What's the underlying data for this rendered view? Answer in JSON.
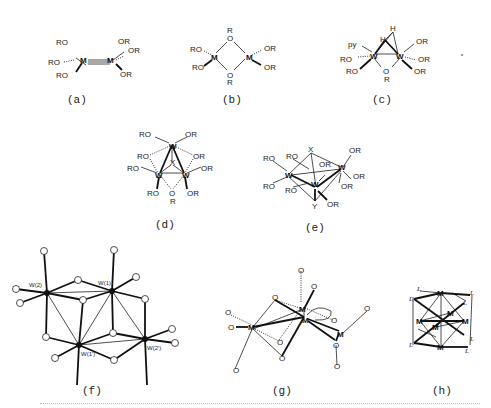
{
  "figure": {
    "panels": [
      {
        "id": "a",
        "label": "(a)",
        "metals": [
          "M",
          "M"
        ],
        "ligands": [
          "RO",
          "RO",
          "RO",
          "OR",
          "OR",
          "OR"
        ],
        "bond": "triple M≡M"
      },
      {
        "id": "b",
        "label": "(b)",
        "metals": [
          "M",
          "M"
        ],
        "bridges": [
          "O",
          "O"
        ],
        "bridge_substituents": [
          "R",
          "R"
        ],
        "ligands": [
          "RO",
          "RO",
          "OR",
          "OR"
        ]
      },
      {
        "id": "c",
        "label": "(c)",
        "metals": [
          "W",
          "W"
        ],
        "ligands": [
          "py",
          "RO",
          "RO",
          "OR",
          "OR",
          "OR"
        ],
        "bridge": "O",
        "bridge_substituent": "R",
        "hydrides": [
          "H",
          "H"
        ]
      },
      {
        "id": "d",
        "label": "(d)",
        "metals": [
          "W",
          "W",
          "W"
        ],
        "capping": "X",
        "ligands": [
          "RO",
          "OR",
          "RO",
          "OR",
          "RO",
          "OR",
          "RO",
          "OR"
        ],
        "bridge": "O",
        "bridge_substituent": "R"
      },
      {
        "id": "e",
        "label": "(e)",
        "metals": [
          "W",
          "W",
          "W"
        ],
        "capping": [
          "X",
          "Y"
        ],
        "ligands": [
          "RO",
          "RO",
          "RO",
          "RO",
          "OR",
          "OR",
          "OR",
          "OR",
          "OR"
        ]
      },
      {
        "id": "f",
        "label": "(f)",
        "atom_labels": [
          "W(2)",
          "W(1)",
          "W(1')",
          "W(2')"
        ]
      },
      {
        "id": "g",
        "label": "(g)",
        "metals": [
          "M",
          "M",
          "M",
          "M"
        ],
        "oxygen_label": "O"
      },
      {
        "id": "h",
        "label": "(h)",
        "metals": [
          "M",
          "M",
          "M",
          "M",
          "M",
          "M"
        ],
        "ligand_label": "L"
      }
    ]
  },
  "text": {
    "a": {
      "label": "(a)",
      "M": "M",
      "RO": "RO",
      "OR": "OR"
    },
    "b": {
      "label": "(b)",
      "M": "M",
      "O": "O",
      "R": "R",
      "RO": "RO",
      "OR": "OR"
    },
    "c": {
      "label": "(c)",
      "W": "W",
      "H": "H",
      "py": "py",
      "RO": "RO",
      "OR": "OR",
      "O": "O",
      "R": "R"
    },
    "d": {
      "label": "(d)",
      "W": "W",
      "X": "X",
      "RO": "RO",
      "OR": "OR",
      "O": "O",
      "R": "R"
    },
    "e": {
      "label": "(e)",
      "W": "W",
      "X": "X",
      "Y": "Y",
      "RO": "RO",
      "OR": "OR"
    },
    "f": {
      "label": "(f)",
      "w2": "W(2)",
      "w1": "W(1)",
      "w1p": "W(1')",
      "w2p": "W(2')"
    },
    "g": {
      "label": "(g)",
      "M": "M",
      "O": "O"
    },
    "h": {
      "label": "(h)",
      "M": "M",
      "L": "L"
    }
  }
}
